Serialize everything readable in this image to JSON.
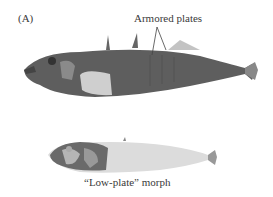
{
  "figure": {
    "panel_label": "(A)",
    "annotation_top": "Armored plates",
    "caption_bottom": "“Low-plate” morph",
    "subjects": [
      {
        "name": "complete-plate stickleback",
        "description": "fully armored fish with dorsal spines"
      },
      {
        "name": "low-plate stickleback",
        "description": "low-plate morph, pale body"
      }
    ],
    "colors": {
      "armored_fish": "#5a5a5a",
      "low_plate_fish": "#d4d4d4",
      "text": "#3a3a3a"
    }
  }
}
